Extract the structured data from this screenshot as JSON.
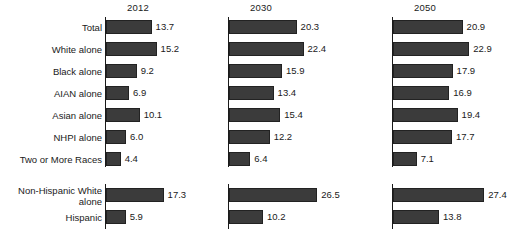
{
  "chart_data": {
    "type": "bar",
    "orientation": "horizontal",
    "title": "",
    "xlabel": "",
    "ylabel": "",
    "grid": false,
    "legend": false,
    "xlim": [
      0,
      30
    ],
    "categories": [
      "Total",
      "White alone",
      "Black alone",
      "AIAN alone",
      "Asian alone",
      "NHPI alone",
      "Two or More Races",
      "Non-Hispanic White alone",
      "Hispanic"
    ],
    "category_lines": [
      [
        "Total"
      ],
      [
        "White alone"
      ],
      [
        "Black alone"
      ],
      [
        "AIAN alone"
      ],
      [
        "Asian alone"
      ],
      [
        "NHPI alone"
      ],
      [
        "Two or More Races"
      ],
      [
        "Non-Hispanic White",
        "alone"
      ],
      [
        "Hispanic"
      ]
    ],
    "panels": [
      {
        "title": "2012",
        "values": [
          13.7,
          15.2,
          9.2,
          6.9,
          10.1,
          6.0,
          4.4,
          17.3,
          5.9
        ],
        "labels": [
          "13.7",
          "15.2",
          "9.2",
          "6.9",
          "10.1",
          "6.0",
          "4.4",
          "17.3",
          "5.9"
        ]
      },
      {
        "title": "2030",
        "values": [
          20.3,
          22.4,
          15.9,
          13.4,
          15.4,
          12.2,
          6.4,
          26.5,
          10.2
        ],
        "labels": [
          "20.3",
          "22.4",
          "15.9",
          "13.4",
          "15.4",
          "12.2",
          "6.4",
          "26.5",
          "10.2"
        ]
      },
      {
        "title": "2050",
        "values": [
          20.9,
          22.9,
          17.9,
          16.9,
          19.4,
          17.7,
          7.1,
          27.4,
          13.8
        ],
        "labels": [
          "20.9",
          "22.9",
          "17.9",
          "16.9",
          "19.4",
          "17.7",
          "7.1",
          "27.4",
          "13.8"
        ]
      }
    ],
    "series": [
      {
        "name": "2012",
        "values": [
          13.7,
          15.2,
          9.2,
          6.9,
          10.1,
          6.0,
          4.4,
          17.3,
          5.9
        ]
      },
      {
        "name": "2030",
        "values": [
          20.3,
          22.4,
          15.9,
          13.4,
          15.4,
          12.2,
          6.4,
          26.5,
          10.2
        ]
      },
      {
        "name": "2050",
        "values": [
          20.9,
          22.9,
          17.9,
          16.9,
          19.4,
          17.7,
          7.1,
          27.4,
          13.8
        ]
      }
    ],
    "colors": {
      "bar_fill": "#3b3b3b",
      "bar_stroke": "#222222",
      "axis": "#1a1a1a",
      "text": "#1a1a1a",
      "background": "#ffffff"
    },
    "group_break_after_index": 6
  },
  "layout": {
    "panel_origins_px": [
      105,
      228,
      392
    ],
    "px_per_unit": 3.33,
    "row_tops_px": [
      20,
      42,
      64,
      86,
      108,
      130,
      152,
      188,
      210
    ],
    "bar_height_px": 14
  }
}
